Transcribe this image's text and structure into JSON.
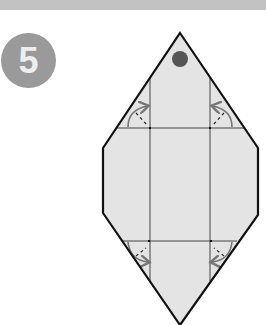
{
  "step": {
    "number": "5",
    "badge_color": "#9a9a9a"
  },
  "header_bar": {
    "color": "#c2c2c2"
  },
  "diagram": {
    "type": "origami-fold-step",
    "paper_fill": "#e4e4e4",
    "outline_color": "#111111",
    "crease_color": "#444444",
    "arrow_color": "#777777",
    "marker_dot_color": "#555555",
    "outline_points": [
      [
        180,
        33
      ],
      [
        258,
        148
      ],
      [
        258,
        215
      ],
      [
        180,
        325
      ],
      [
        103,
        213
      ],
      [
        103,
        148
      ]
    ],
    "vertical_creases_x": [
      150,
      210
    ],
    "horizontal_creases_y": [
      128,
      241
    ],
    "fold_arrows": [
      {
        "position": "top-left",
        "direction": "fold-in"
      },
      {
        "position": "top-right",
        "direction": "fold-in"
      },
      {
        "position": "bottom-left",
        "direction": "fold-in"
      },
      {
        "position": "bottom-right",
        "direction": "fold-in"
      }
    ]
  }
}
